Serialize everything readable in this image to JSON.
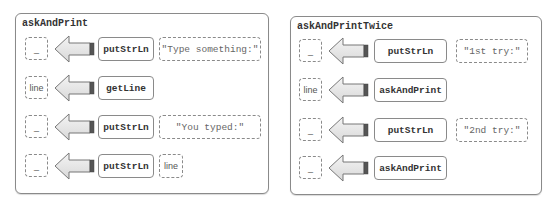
{
  "panels": [
    {
      "title": "askAndPrint",
      "rows": [
        {
          "result": "_",
          "function": "putStrLn",
          "argument": "\"Type something:\""
        },
        {
          "result": "line",
          "function": "getLine",
          "argument": null
        },
        {
          "result": "_",
          "function": "putStrLn",
          "argument": "\"You typed:\""
        },
        {
          "result": "_",
          "function": "putStrLn",
          "argument": "line"
        }
      ]
    },
    {
      "title": "askAndPrintTwice",
      "rows": [
        {
          "result": "_",
          "function": "putStrLn",
          "argument": "\"1st try:\""
        },
        {
          "result": "line",
          "function": "askAndPrint",
          "argument": null
        },
        {
          "result": "_",
          "function": "putStrLn",
          "argument": "\"2nd try:\""
        },
        {
          "result": "_",
          "function": "askAndPrint",
          "argument": null
        }
      ]
    }
  ],
  "colors": {
    "border": "#8a8a8a",
    "arrow_fill": "#e6e6e6",
    "arrow_tail": "#555555"
  }
}
